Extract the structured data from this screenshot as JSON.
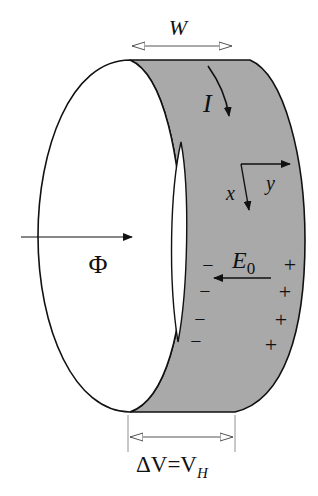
{
  "diagram": {
    "colors": {
      "band_fill": "#a9a9a9",
      "face_fill": "#ffffff",
      "stroke": "#111111",
      "dimension_arrow": "#555555"
    },
    "labels": {
      "width": "W",
      "current": "I",
      "axis_x": "x",
      "axis_y": "y",
      "field": "E",
      "field_subscript": "0",
      "flux": "Φ",
      "voltage_prefix": "ΔV=V",
      "voltage_subscript": "H"
    },
    "charges": {
      "negative": [
        "−",
        "−",
        "−",
        "−"
      ],
      "positive": [
        "+",
        "+",
        "+",
        "+"
      ]
    }
  }
}
